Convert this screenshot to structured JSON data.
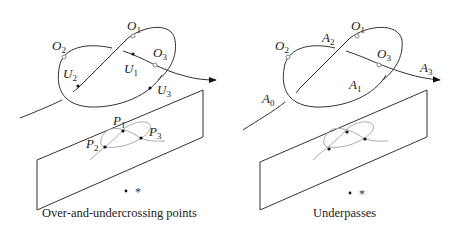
{
  "left_panel": {
    "caption": "Over-and-undercrossing points",
    "over_labels": [
      {
        "main": "O",
        "sub": "1"
      },
      {
        "main": "O",
        "sub": "2"
      },
      {
        "main": "O",
        "sub": "3"
      }
    ],
    "under_labels": [
      {
        "main": "U",
        "sub": "1"
      },
      {
        "main": "U",
        "sub": "2"
      },
      {
        "main": "U",
        "sub": "3"
      }
    ],
    "projection_labels": [
      {
        "main": "P",
        "sub": "1"
      },
      {
        "main": "P",
        "sub": "2"
      },
      {
        "main": "P",
        "sub": "3"
      }
    ],
    "viewpoint": "*"
  },
  "right_panel": {
    "caption": "Underpasses",
    "over_labels": [
      {
        "main": "O",
        "sub": "1"
      },
      {
        "main": "O",
        "sub": "2"
      },
      {
        "main": "O",
        "sub": "3"
      }
    ],
    "arc_labels": [
      {
        "main": "A",
        "sub": "0"
      },
      {
        "main": "A",
        "sub": "1"
      },
      {
        "main": "A",
        "sub": "2"
      },
      {
        "main": "A",
        "sub": "3"
      }
    ],
    "viewpoint": "*"
  }
}
